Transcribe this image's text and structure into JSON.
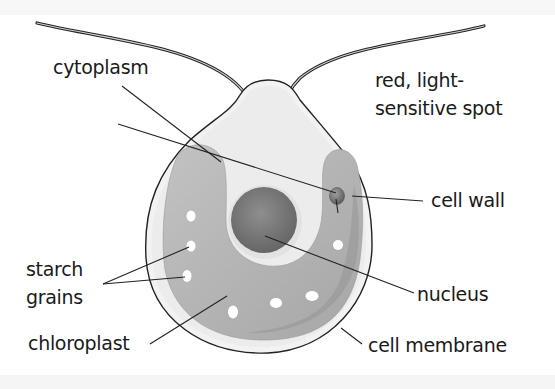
{
  "diagram": {
    "labels": {
      "cytoplasm": "cytoplasm",
      "eyespot_line1": "red, light-",
      "eyespot_line2": "sensitive spot",
      "cell_wall": "cell wall",
      "starch_line1": "starch",
      "starch_line2": "grains",
      "nucleus": "nucleus",
      "chloroplast": "chloroplast",
      "cell_membrane": "cell membrane"
    },
    "colors": {
      "background": "#ffffff",
      "outline": "#222222",
      "cytoplasm_fill": "#eeeeee",
      "membrane_fill": "#f4f4f4",
      "chloroplast_fill": "#b5b5b5",
      "nucleus_fill": "#7d7d7d",
      "starch_fill": "#ffffff",
      "eyespot_fill": "#7a7a7a"
    }
  }
}
